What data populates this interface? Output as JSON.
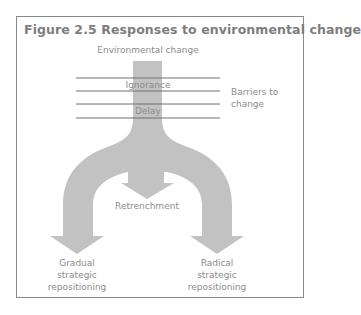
{
  "figure": {
    "title": "Figure 2.5  Responses to environmental change",
    "colors": {
      "flow_fill": "#c2c2c2",
      "line": "#6e6e6e",
      "border": "#8a8a8a",
      "text": "#8c8c8c",
      "title": "#7d7d7d"
    }
  },
  "diagram": {
    "input_label": "Environmental change",
    "barriers": [
      {
        "label": "Ignorance"
      },
      {
        "label": "Delay"
      }
    ],
    "barriers_label_line1": "Barriers to",
    "barriers_label_line2": "change",
    "outcomes": {
      "center": {
        "label": "Retrenchment"
      },
      "left": {
        "line1": "Gradual",
        "line2": "strategic",
        "line3": "repositioning"
      },
      "right": {
        "line1": "Radical",
        "line2": "strategic",
        "line3": "repositioning"
      }
    }
  }
}
